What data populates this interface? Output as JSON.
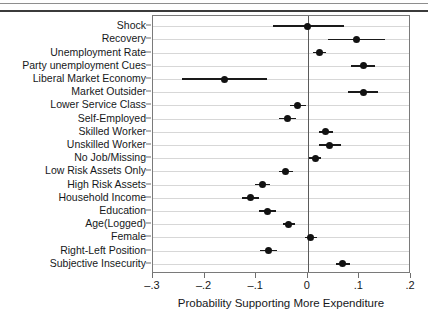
{
  "figure": {
    "type": "coefficient-plot",
    "background": "#ffffff",
    "point_color": "#121212",
    "ci_color": "#1a1a1a",
    "grid_color": "#d7d7d7",
    "zero_line_color": "#5a5a5a"
  },
  "chart_data": {
    "type": "scatter",
    "title": "",
    "xlabel": "Probability Supporting More Expenditure",
    "ylabel": "",
    "xlim": [
      -0.3,
      0.2
    ],
    "xticks": [
      -0.3,
      -0.2,
      -0.1,
      0,
      0.1,
      0.2
    ],
    "xticklabels": [
      "–.3",
      "–.2",
      "–.1",
      "0",
      ".1",
      ".2"
    ],
    "grid": true,
    "legend": false,
    "reference_line": 0,
    "orientation": "horizontal",
    "categories": [
      "Shock",
      "Recovery",
      "Unemployment Rate",
      "Party unemployment Cues",
      "Liberal Market Economy",
      "Market Outsider",
      "Lower Service Class",
      "Self-Employed",
      "Skilled Worker",
      "Unskilled Worker",
      "No Job/Missing",
      "Low Risk Assets Only",
      "High Risk Assets",
      "Household Income",
      "Education",
      "Age(Logged)",
      "Female",
      "Right-Left Position",
      "Subjective Insecurity"
    ],
    "values": [
      0.0,
      0.094,
      0.023,
      0.108,
      -0.162,
      0.107,
      -0.02,
      -0.039,
      0.035,
      0.043,
      0.014,
      -0.043,
      -0.088,
      -0.111,
      -0.078,
      -0.037,
      0.006,
      -0.076,
      0.068
    ],
    "ci_low": [
      -0.068,
      0.039,
      0.01,
      0.084,
      -0.244,
      0.078,
      -0.035,
      -0.056,
      0.021,
      0.022,
      0.003,
      -0.056,
      -0.103,
      -0.127,
      -0.094,
      -0.049,
      -0.005,
      -0.092,
      0.055
    ],
    "ci_high": [
      0.07,
      0.15,
      0.036,
      0.131,
      -0.08,
      0.136,
      -0.004,
      -0.022,
      0.049,
      0.064,
      0.026,
      -0.029,
      -0.073,
      -0.094,
      -0.062,
      -0.025,
      0.017,
      -0.06,
      0.081
    ]
  }
}
